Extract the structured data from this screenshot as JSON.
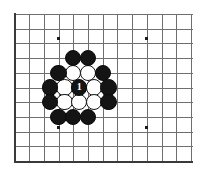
{
  "diagram": {
    "type": "go-board-diagram",
    "board": {
      "origin_x": 14.5,
      "origin_y": 14.0,
      "spacing": 14.7,
      "cols": 13,
      "rows": 11,
      "grid_color": "#6f6f6f",
      "edge_color": "#3a3a3a",
      "background_color": "#ffffff",
      "edges": [
        "left",
        "bottom"
      ],
      "star_points": [
        {
          "col": 3,
          "row": 1.65
        },
        {
          "col": 9,
          "row": 1.65
        },
        {
          "col": 3,
          "row": 7.75
        },
        {
          "col": 9,
          "row": 7.75
        }
      ]
    },
    "stone_radius": 8.2,
    "stones": [
      {
        "col": 4.0,
        "row": 3.0,
        "color": "black",
        "label": ""
      },
      {
        "col": 5.0,
        "row": 3.0,
        "color": "black",
        "label": ""
      },
      {
        "col": 3.0,
        "row": 4.0,
        "color": "black",
        "label": ""
      },
      {
        "col": 4.0,
        "row": 4.0,
        "color": "white",
        "label": ""
      },
      {
        "col": 5.0,
        "row": 4.0,
        "color": "white",
        "label": ""
      },
      {
        "col": 6.0,
        "row": 4.0,
        "color": "black",
        "label": ""
      },
      {
        "col": 2.4,
        "row": 5.0,
        "color": "black",
        "label": ""
      },
      {
        "col": 3.4,
        "row": 5.0,
        "color": "white",
        "label": ""
      },
      {
        "col": 4.4,
        "row": 5.0,
        "color": "black",
        "label": "1"
      },
      {
        "col": 5.4,
        "row": 5.0,
        "color": "white",
        "label": ""
      },
      {
        "col": 6.4,
        "row": 5.0,
        "color": "black",
        "label": ""
      },
      {
        "col": 2.4,
        "row": 6.0,
        "color": "black",
        "label": ""
      },
      {
        "col": 3.4,
        "row": 6.0,
        "color": "white",
        "label": ""
      },
      {
        "col": 4.4,
        "row": 6.0,
        "color": "white",
        "label": ""
      },
      {
        "col": 5.4,
        "row": 6.0,
        "color": "white",
        "label": ""
      },
      {
        "col": 6.4,
        "row": 6.0,
        "color": "black",
        "label": ""
      },
      {
        "col": 3.0,
        "row": 7.0,
        "color": "black",
        "label": ""
      },
      {
        "col": 4.0,
        "row": 7.0,
        "color": "black",
        "label": ""
      },
      {
        "col": 5.0,
        "row": 7.0,
        "color": "black",
        "label": ""
      }
    ],
    "marked_move": {
      "number": "1",
      "color": "black",
      "col": 4.4,
      "row": 5.0
    }
  }
}
